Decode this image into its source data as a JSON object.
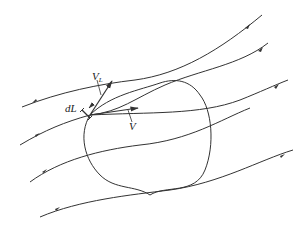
{
  "diagram": {
    "labels": {
      "velocity": "V",
      "velocity_component_main": "V",
      "velocity_component_sub": "L",
      "line_element_main": "dL",
      "line_element_sub": ""
    },
    "colors": {
      "stroke": "#333333",
      "background": "#ffffff"
    },
    "streamline_count": 5
  }
}
